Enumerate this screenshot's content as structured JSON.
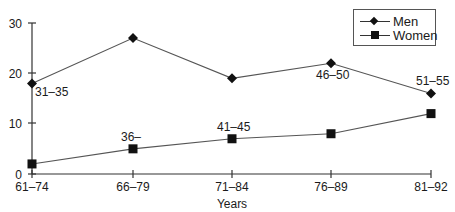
{
  "chart_data": {
    "type": "line",
    "title": "",
    "xlabel": "Years",
    "ylabel": "",
    "categories": [
      "61–74",
      "66–79",
      "71–84",
      "76–89",
      "81–92"
    ],
    "ylim": [
      0,
      30
    ],
    "yticks": [
      "0",
      "10",
      "20",
      "30"
    ],
    "grid": false,
    "legend_position": "top-right",
    "series": [
      {
        "name": "Men",
        "marker": "diamond",
        "values": [
          18,
          27,
          19,
          22,
          16
        ]
      },
      {
        "name": "Women",
        "marker": "square",
        "values": [
          2,
          5,
          7,
          8,
          12
        ]
      }
    ],
    "annotations": [
      {
        "text": "31–35",
        "series": "Men",
        "x": "61–74"
      },
      {
        "text": "36–",
        "series": "Women",
        "x": "66–79"
      },
      {
        "text": "41–45",
        "series": "Women",
        "x": "71–84"
      },
      {
        "text": "46–50",
        "series": "Men",
        "x": "76–89"
      },
      {
        "text": "51–55",
        "series": "Men",
        "x": "81–92"
      }
    ]
  },
  "legend": {
    "men": "Men",
    "women": "Women"
  },
  "axis": {
    "x_label": "Years",
    "x_ticks": [
      "61–74",
      "66–79",
      "71–84",
      "76–89",
      "81–92"
    ],
    "y_ticks": [
      "0",
      "10",
      "20",
      "30"
    ]
  },
  "annotations": {
    "a1": "31–35",
    "a2": "36–",
    "a3": "41–45",
    "a4": "46–50",
    "a5": "51–55"
  }
}
